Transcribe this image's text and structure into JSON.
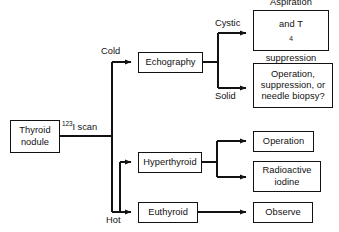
{
  "diagram": {
    "type": "flowchart",
    "background_color": "#ffffff",
    "line_color": "#121212",
    "text_color": "#111111"
  },
  "nodes": {
    "thyroid_nodule": "Thyroid\nnodule",
    "echography": "Echography",
    "hyperthyroid": "Hyperthyroid",
    "euthyroid": "Euthyroid",
    "aspiration_line1": "Aspiration",
    "aspiration_line2_pre": "and T",
    "aspiration_line2_sub": "4",
    "aspiration_line3": "suppression",
    "operation_suppression": "Operation,\nsuppression, or\nneedle biopsy?",
    "operation": "Operation",
    "radioactive_iodine": "Radioactive\niodine",
    "observe": "Observe"
  },
  "edge_labels": {
    "scan_sup": "123",
    "scan_text": "I scan",
    "cold": "Cold",
    "hot": "Hot",
    "cystic": "Cystic",
    "solid": "Solid"
  }
}
